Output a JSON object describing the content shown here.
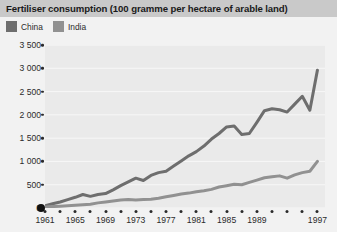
{
  "chart_data": {
    "type": "line",
    "title": "Fertiliser consumption (100 gramme per hectare of arable land)",
    "xlabel": "",
    "ylabel": "",
    "grid": true,
    "legend_position": "top-left",
    "ylim": [
      0,
      3500
    ],
    "xlim": [
      1961,
      1998
    ],
    "y_ticks": [
      0,
      500,
      1000,
      1500,
      2000,
      2500,
      3000,
      3500
    ],
    "y_tick_labels": [
      "0",
      "500",
      "1 000",
      "1 500",
      "2 000",
      "2 500",
      "3 000",
      "3 500"
    ],
    "x_ticks": [
      1961,
      1963,
      1965,
      1967,
      1969,
      1971,
      1973,
      1975,
      1977,
      1979,
      1981,
      1983,
      1985,
      1987,
      1989,
      1991,
      1993,
      1995,
      1997
    ],
    "x_tick_labels": [
      "1961",
      "1965",
      "1969",
      "1973",
      "1977",
      "1981",
      "1985",
      "1989",
      "1997"
    ],
    "x_labelled_ticks": [
      1961,
      1965,
      1969,
      1973,
      1977,
      1981,
      1985,
      1989,
      1997
    ],
    "x": [
      1961,
      1962,
      1963,
      1964,
      1965,
      1966,
      1967,
      1968,
      1969,
      1970,
      1971,
      1972,
      1973,
      1974,
      1975,
      1976,
      1977,
      1978,
      1979,
      1980,
      1981,
      1982,
      1983,
      1984,
      1985,
      1986,
      1987,
      1988,
      1989,
      1990,
      1991,
      1992,
      1993,
      1994,
      1995,
      1996,
      1997
    ],
    "series": [
      {
        "name": "China",
        "color": "#6e6e6e",
        "values": [
          50,
          90,
          130,
          180,
          230,
          290,
          250,
          290,
          310,
          390,
          480,
          560,
          640,
          590,
          700,
          760,
          790,
          900,
          1010,
          1120,
          1210,
          1330,
          1480,
          1600,
          1740,
          1760,
          1580,
          1600,
          1840,
          2090,
          2130,
          2110,
          2060,
          2230,
          2400,
          2100,
          2960
        ]
      },
      {
        "name": "India",
        "color": "#919191",
        "values": [
          20,
          30,
          40,
          50,
          60,
          70,
          80,
          110,
          130,
          150,
          170,
          180,
          170,
          180,
          190,
          210,
          240,
          270,
          300,
          320,
          350,
          370,
          400,
          450,
          480,
          510,
          500,
          550,
          600,
          650,
          670,
          690,
          640,
          710,
          760,
          790,
          1000
        ]
      }
    ]
  },
  "legend": {
    "items": [
      {
        "label": "China",
        "color": "#6e6e6e"
      },
      {
        "label": "India",
        "color": "#919191"
      }
    ]
  }
}
